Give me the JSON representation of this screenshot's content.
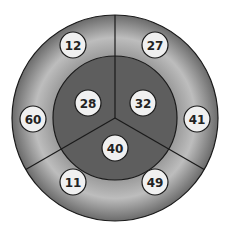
{
  "diagram": {
    "type": "concentric-segmented-circle",
    "center": [
      115,
      118
    ],
    "outer_radius": 103,
    "inner_radius": 62,
    "colors": {
      "outer_ring_edge": "#6b6b6b",
      "outer_ring_mid": "#bdbdbd",
      "inner_disc": "#5e5e5e",
      "divider": "#1a1a1a",
      "bubble_fill": "#f0f0f0",
      "bubble_stroke": "#1a1a1a"
    },
    "inner_bubbles": [
      {
        "label": "28",
        "x": 88,
        "y": 103
      },
      {
        "label": "32",
        "x": 143,
        "y": 103
      },
      {
        "label": "40",
        "x": 115,
        "y": 148
      }
    ],
    "outer_bubbles": [
      {
        "label": "12",
        "x": 73,
        "y": 45
      },
      {
        "label": "27",
        "x": 155,
        "y": 45
      },
      {
        "label": "60",
        "x": 33,
        "y": 119
      },
      {
        "label": "41",
        "x": 197,
        "y": 119
      },
      {
        "label": "11",
        "x": 73,
        "y": 182
      },
      {
        "label": "49",
        "x": 155,
        "y": 182
      }
    ]
  }
}
